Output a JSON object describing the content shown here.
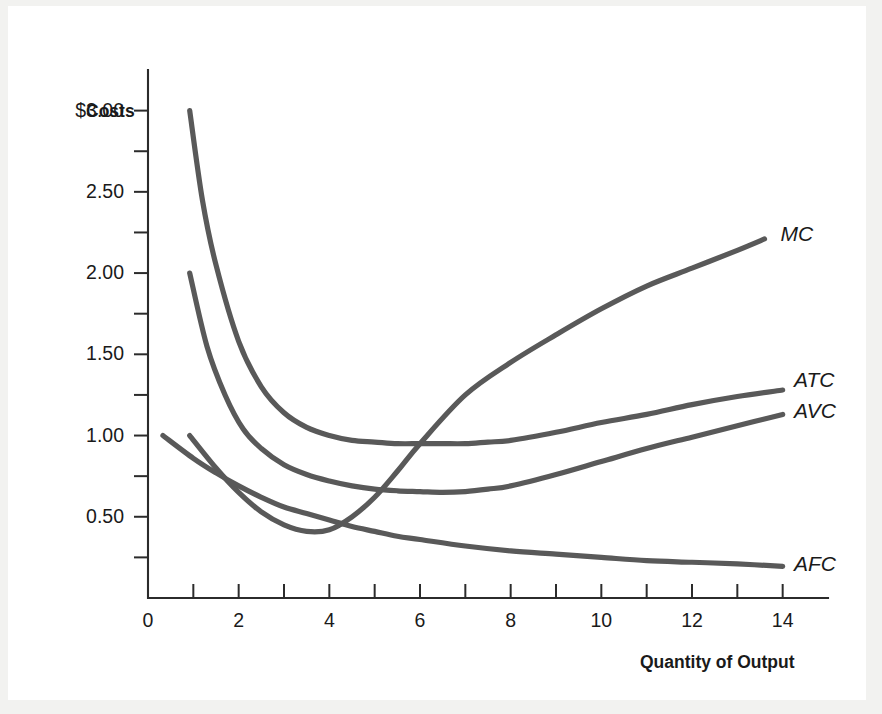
{
  "figure": {
    "background_color": "#f2f2f0",
    "plate_color": "#ffffff",
    "curve_color": "#595959",
    "axis_color": "#2b2b2b"
  },
  "chart_data": {
    "type": "line",
    "title": "",
    "subtitle": "",
    "xlabel": "Quantity of Output",
    "ylabel": "Costs",
    "xlim": [
      0,
      15
    ],
    "ylim": [
      0,
      3.25
    ],
    "grid": false,
    "legend_position": "right-of-curve-ends",
    "x_ticks_major": [
      0,
      2,
      4,
      6,
      8,
      10,
      12,
      14
    ],
    "x_tick_labels": [
      "0",
      "2",
      "4",
      "6",
      "8",
      "10",
      "12",
      "14"
    ],
    "x_ticks_minor": [
      1,
      3,
      5,
      7,
      9,
      11,
      13
    ],
    "y_ticks_major": [
      0.5,
      1.0,
      1.5,
      2.0,
      2.5,
      3.0
    ],
    "y_tick_labels": [
      "0.50",
      "1.00",
      "1.50",
      "2.00",
      "2.50",
      "$3.00"
    ],
    "y_ticks_minor": [
      0.25,
      0.75,
      1.25,
      1.75,
      2.25,
      2.75
    ],
    "series": [
      {
        "name": "MC",
        "label": "MC",
        "label_x": 13.95,
        "label_y": 2.23,
        "points": [
          [
            0.92,
            1.0
          ],
          [
            1.5,
            0.8
          ],
          [
            2.0,
            0.65
          ],
          [
            2.5,
            0.53
          ],
          [
            3.0,
            0.45
          ],
          [
            3.5,
            0.41
          ],
          [
            4.0,
            0.42
          ],
          [
            4.5,
            0.5
          ],
          [
            5.0,
            0.62
          ],
          [
            5.5,
            0.78
          ],
          [
            6.0,
            0.95
          ],
          [
            7.0,
            1.25
          ],
          [
            8.0,
            1.45
          ],
          [
            9.0,
            1.62
          ],
          [
            10.0,
            1.78
          ],
          [
            11.0,
            1.92
          ],
          [
            12.0,
            2.03
          ],
          [
            13.0,
            2.14
          ],
          [
            13.6,
            2.21
          ]
        ]
      },
      {
        "name": "ATC",
        "label": "ATC",
        "label_x": 14.25,
        "label_y": 1.33,
        "points": [
          [
            0.92,
            3.0
          ],
          [
            1.2,
            2.45
          ],
          [
            1.5,
            2.05
          ],
          [
            2.0,
            1.58
          ],
          [
            2.5,
            1.3
          ],
          [
            3.0,
            1.14
          ],
          [
            3.5,
            1.05
          ],
          [
            4.0,
            1.0
          ],
          [
            4.5,
            0.97
          ],
          [
            5.0,
            0.96
          ],
          [
            5.5,
            0.95
          ],
          [
            6.0,
            0.95
          ],
          [
            6.5,
            0.95
          ],
          [
            7.0,
            0.95
          ],
          [
            7.5,
            0.96
          ],
          [
            8.0,
            0.97
          ],
          [
            9.0,
            1.02
          ],
          [
            10.0,
            1.08
          ],
          [
            11.0,
            1.13
          ],
          [
            12.0,
            1.19
          ],
          [
            13.0,
            1.24
          ],
          [
            14.0,
            1.28
          ]
        ]
      },
      {
        "name": "AVC",
        "label": "AVC",
        "label_x": 14.25,
        "label_y": 1.14,
        "points": [
          [
            0.92,
            2.0
          ],
          [
            1.3,
            1.55
          ],
          [
            1.7,
            1.25
          ],
          [
            2.1,
            1.04
          ],
          [
            2.5,
            0.92
          ],
          [
            3.0,
            0.82
          ],
          [
            3.5,
            0.76
          ],
          [
            4.0,
            0.72
          ],
          [
            4.5,
            0.69
          ],
          [
            5.0,
            0.67
          ],
          [
            5.5,
            0.66
          ],
          [
            6.0,
            0.655
          ],
          [
            6.5,
            0.65
          ],
          [
            7.0,
            0.655
          ],
          [
            7.5,
            0.67
          ],
          [
            8.0,
            0.69
          ],
          [
            9.0,
            0.76
          ],
          [
            10.0,
            0.84
          ],
          [
            11.0,
            0.92
          ],
          [
            12.0,
            0.99
          ],
          [
            13.0,
            1.06
          ],
          [
            14.0,
            1.13
          ]
        ]
      },
      {
        "name": "AFC",
        "label": "AFC",
        "label_x": 14.25,
        "label_y": 0.2,
        "points": [
          [
            0.33,
            1.0
          ],
          [
            1.0,
            0.86
          ],
          [
            1.5,
            0.77
          ],
          [
            2.0,
            0.69
          ],
          [
            2.5,
            0.62
          ],
          [
            3.0,
            0.56
          ],
          [
            3.5,
            0.52
          ],
          [
            4.0,
            0.48
          ],
          [
            4.5,
            0.44
          ],
          [
            5.0,
            0.41
          ],
          [
            5.5,
            0.38
          ],
          [
            6.0,
            0.36
          ],
          [
            7.0,
            0.32
          ],
          [
            8.0,
            0.29
          ],
          [
            9.0,
            0.27
          ],
          [
            10.0,
            0.25
          ],
          [
            11.0,
            0.23
          ],
          [
            12.0,
            0.22
          ],
          [
            13.0,
            0.21
          ],
          [
            14.0,
            0.195
          ]
        ]
      }
    ]
  }
}
